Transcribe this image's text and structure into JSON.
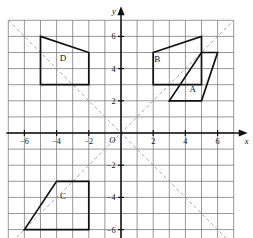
{
  "chart_data": {
    "type": "scatter",
    "title": "",
    "xlabel": "x",
    "ylabel": "y",
    "origin_label": "O",
    "xlim": [
      -7,
      7
    ],
    "ylim": [
      -7,
      7
    ],
    "grid": true,
    "grid_step": 1,
    "x_tick_labels": [
      {
        "value": -6,
        "text": "−6"
      },
      {
        "value": -4,
        "text": "−4"
      },
      {
        "value": -2,
        "text": "−2"
      },
      {
        "value": 2,
        "text": "2"
      },
      {
        "value": 4,
        "text": "4"
      },
      {
        "value": 6,
        "text": "6"
      }
    ],
    "y_tick_labels": [
      {
        "value": 6,
        "text": "6"
      },
      {
        "value": 4,
        "text": "4"
      },
      {
        "value": 2,
        "text": "2"
      },
      {
        "value": -2,
        "text": "−2"
      },
      {
        "value": -4,
        "text": "−4"
      },
      {
        "value": -6,
        "text": "−6"
      }
    ],
    "reference_lines": [
      {
        "name": "y = x",
        "style": "dashed",
        "from": [
          -7,
          -7
        ],
        "to": [
          7,
          7
        ]
      },
      {
        "name": "y = -x",
        "style": "dashed",
        "from": [
          -7,
          7
        ],
        "to": [
          7,
          -7
        ]
      }
    ],
    "shapes": [
      {
        "id": "A",
        "label": "A",
        "label_pos": [
          4.45,
          2.55
        ],
        "vertices": [
          [
            3,
            2
          ],
          [
            5,
            2
          ],
          [
            6,
            5
          ],
          [
            5,
            5
          ]
        ]
      },
      {
        "id": "B",
        "label": "B",
        "label_pos": [
          2.25,
          4.4
        ],
        "vertices": [
          [
            2,
            5
          ],
          [
            5,
            6
          ],
          [
            5,
            3
          ],
          [
            2,
            3
          ]
        ]
      },
      {
        "id": "C",
        "label": "C",
        "label_pos": [
          -3.6,
          -4.1
        ],
        "vertices": [
          [
            -6,
            -6
          ],
          [
            -4,
            -3
          ],
          [
            -2,
            -3
          ],
          [
            -2,
            -6
          ]
        ]
      },
      {
        "id": "D",
        "label": "D",
        "label_pos": [
          -3.6,
          4.5
        ],
        "vertices": [
          [
            -5,
            6
          ],
          [
            -2,
            5
          ],
          [
            -2,
            3
          ],
          [
            -5,
            3
          ]
        ]
      }
    ],
    "colors": {
      "shape_stroke": "#111111",
      "grid": "#6b6b6b",
      "axis": "#111111",
      "dashed": "#9a9a9a",
      "background": "#ffffff"
    }
  }
}
